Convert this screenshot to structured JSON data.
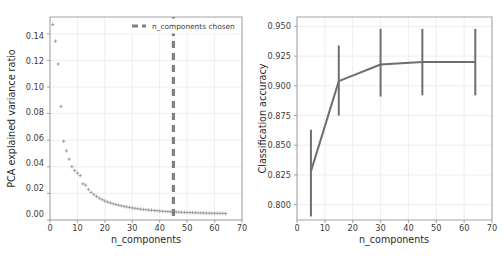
{
  "figure": {
    "name": "pca-components-selection-figure",
    "background": "#ffffff",
    "accent_gray": "#6e6e6e",
    "grid_color": "#e9e9ee",
    "spine_color": "#9a9a9a"
  },
  "chart_data": [
    {
      "type": "scatter",
      "name": "pca-explained-variance-panel",
      "title": "",
      "xlabel": "n_components",
      "ylabel": "PCA explained variance ratio",
      "xlim": [
        0,
        70
      ],
      "ylim": [
        -0.005,
        0.155
      ],
      "xticks": [
        0,
        10,
        20,
        30,
        40,
        50,
        60,
        70
      ],
      "xtick_labels": [
        "0",
        "10",
        "20",
        "30",
        "40",
        "50",
        "60",
        "70"
      ],
      "yticks": [
        0.0,
        0.02,
        0.04,
        0.06,
        0.08,
        0.1,
        0.12,
        0.14
      ],
      "ytick_labels": [
        "0.00",
        "0.02",
        "0.04",
        "0.06",
        "0.08",
        "0.10",
        "0.12",
        "0.14"
      ],
      "grid": true,
      "marker": "plus",
      "marker_color": "#8a8a8a",
      "legend": {
        "position": "upper right",
        "entries": [
          {
            "label": "n_components chosen",
            "style": "dashed-line",
            "color": "#808080"
          }
        ]
      },
      "annotations": [
        {
          "type": "vline",
          "label": "n_components chosen",
          "x": 45,
          "style": "dashed",
          "color": "#808080"
        }
      ],
      "x": [
        1,
        2,
        3,
        4,
        5,
        6,
        7,
        8,
        9,
        10,
        11,
        12,
        13,
        14,
        15,
        16,
        17,
        18,
        19,
        20,
        21,
        22,
        23,
        24,
        25,
        26,
        27,
        28,
        29,
        30,
        31,
        32,
        33,
        34,
        35,
        36,
        37,
        38,
        39,
        40,
        41,
        42,
        43,
        44,
        45,
        46,
        47,
        48,
        49,
        50,
        51,
        52,
        53,
        54,
        55,
        56,
        57,
        58,
        59,
        60,
        61,
        62,
        63,
        64
      ],
      "values": [
        0.149,
        0.136,
        0.118,
        0.0845,
        0.057,
        0.0495,
        0.043,
        0.037,
        0.034,
        0.032,
        0.03,
        0.0235,
        0.0225,
        0.019,
        0.0168,
        0.015,
        0.0135,
        0.0122,
        0.011,
        0.01,
        0.0092,
        0.0085,
        0.0078,
        0.0072,
        0.0067,
        0.0062,
        0.0057,
        0.0053,
        0.0049,
        0.0045,
        0.0042,
        0.0039,
        0.0036,
        0.0033,
        0.0031,
        0.0029,
        0.0027,
        0.0025,
        0.0023,
        0.0021,
        0.0019,
        0.0018,
        0.0016,
        0.0015,
        0.0014,
        0.0013,
        0.0012,
        0.0011,
        0.001,
        0.0009,
        0.0008,
        0.0008,
        0.0007,
        0.0006,
        0.0006,
        0.0005,
        0.0005,
        0.0004,
        0.0004,
        0.0003,
        0.0003,
        0.0002,
        0.0002,
        0.0001
      ]
    },
    {
      "type": "line",
      "name": "classification-accuracy-panel",
      "title": "",
      "xlabel": "n_components",
      "ylabel": "Classification accuracy",
      "xlim": [
        0,
        70
      ],
      "ylim": [
        0.787,
        0.958
      ],
      "xticks": [
        0,
        10,
        20,
        30,
        40,
        50,
        60,
        70
      ],
      "xtick_labels": [
        "0",
        "10",
        "20",
        "30",
        "40",
        "50",
        "60",
        "70"
      ],
      "yticks": [
        0.8,
        0.825,
        0.85,
        0.875,
        0.9,
        0.925,
        0.95
      ],
      "ytick_labels": [
        "0.800",
        "0.825",
        "0.850",
        "0.875",
        "0.900",
        "0.925",
        "0.950"
      ],
      "grid": true,
      "line_color": "#6e6e6e",
      "errorbar_color": "#6e6e6e",
      "x": [
        5,
        15,
        30,
        45,
        64
      ],
      "values": [
        0.828,
        0.904,
        0.918,
        0.92,
        0.92
      ],
      "err_low": [
        0.79,
        0.875,
        0.891,
        0.892,
        0.892
      ],
      "err_high": [
        0.863,
        0.934,
        0.948,
        0.948,
        0.948
      ]
    }
  ]
}
